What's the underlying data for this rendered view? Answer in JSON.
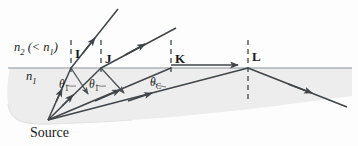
{
  "figure": {
    "source_label": "Source",
    "media": {
      "upper_label": "n",
      "upper_sub": "2",
      "upper_paren": "(< n",
      "upper_paren_sub": "1",
      "upper_paren_close": ")",
      "lower_label": "n",
      "lower_sub": "1"
    },
    "points": [
      {
        "id": "I",
        "label": "I",
        "x": 72,
        "y": 68
      },
      {
        "id": "J",
        "label": "J",
        "x": 102,
        "y": 68
      },
      {
        "id": "K",
        "label": "K",
        "x": 172,
        "y": 68
      },
      {
        "id": "L",
        "label": "L",
        "x": 249,
        "y": 68
      }
    ],
    "angles": [
      {
        "label": "θ",
        "sub": "1",
        "x": 62,
        "y": 84
      },
      {
        "label": "θ",
        "sub": "1",
        "x": 92,
        "y": 84
      },
      {
        "label": "θ",
        "sub": "C",
        "x": 155,
        "y": 82
      }
    ],
    "colors": {
      "ray": "#3f4548",
      "interface": "#8d9498",
      "medium_fill": "#ececec",
      "normal_dash": "#3f4548",
      "text": "#1a1a1a",
      "background": "#fdfdfd"
    },
    "geometry": {
      "source": {
        "x": 48,
        "y": 120
      },
      "interface_y": 68,
      "interface_x_start": 8,
      "interface_x_end": 352
    },
    "rays": [
      {
        "name": "incident-to-I",
        "from": "source",
        "to": "I"
      },
      {
        "name": "incident-to-J",
        "from": "source",
        "to": "J"
      },
      {
        "name": "incident-to-K",
        "from": "source",
        "to": "K"
      },
      {
        "name": "incident-to-L",
        "from": "source",
        "to": "L"
      },
      {
        "name": "refracted-at-I",
        "from": "I",
        "note": "steep refracted ray into medium 2"
      },
      {
        "name": "refracted-at-J",
        "from": "J",
        "note": "shallower refracted ray into medium 2"
      },
      {
        "name": "grazing-at-K",
        "from": "K",
        "note": "refracted ray grazes along interface at 90 degrees"
      },
      {
        "name": "reflected-at-I",
        "from": "I",
        "note": "weak partial reflection"
      },
      {
        "name": "reflected-at-J",
        "from": "J",
        "note": "weak partial reflection"
      },
      {
        "name": "reflected-at-L",
        "from": "L",
        "note": "total internal reflection"
      }
    ]
  }
}
